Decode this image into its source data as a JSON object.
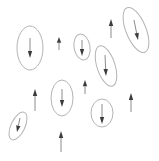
{
  "diagram": {
    "type": "vector-field-with-error-ellipses",
    "width": 159,
    "height": 161,
    "background": "#ffffff",
    "colors": {
      "ellipse_stroke": "#b4b4b4",
      "arrow_shaft": "#8c8c8c",
      "arrow_head": "#3c3c3c"
    },
    "ellipse_vectors": [
      {
        "id": "ev1",
        "cx": 30,
        "cy": 48,
        "rx": 13,
        "ry": 22,
        "rotate": 0,
        "x1": 30,
        "y1": 38,
        "x2": 30,
        "y2": 58,
        "direction": "down"
      },
      {
        "id": "ev2",
        "cx": 136,
        "cy": 30,
        "rx": 10,
        "ry": 24,
        "rotate": -22,
        "x1": 134,
        "y1": 20,
        "x2": 138,
        "y2": 40,
        "direction": "down"
      },
      {
        "id": "ev3",
        "cx": 106,
        "cy": 66,
        "rx": 9,
        "ry": 21,
        "rotate": -18,
        "x1": 105,
        "y1": 55,
        "x2": 106,
        "y2": 76,
        "direction": "down"
      },
      {
        "id": "ev4",
        "cx": 62,
        "cy": 98,
        "rx": 11,
        "ry": 18,
        "rotate": 0,
        "x1": 62,
        "y1": 89,
        "x2": 62,
        "y2": 107,
        "direction": "down"
      },
      {
        "id": "ev5",
        "cx": 18,
        "cy": 126,
        "rx": 7,
        "ry": 15,
        "rotate": 25,
        "x1": 20,
        "y1": 118,
        "x2": 17,
        "y2": 132,
        "direction": "down"
      },
      {
        "id": "ev6",
        "cx": 102,
        "cy": 113,
        "rx": 11,
        "ry": 14,
        "rotate": 0,
        "x1": 102,
        "y1": 104,
        "x2": 102,
        "y2": 124,
        "direction": "down"
      },
      {
        "id": "ev7",
        "cx": 82,
        "cy": 47,
        "rx": 8,
        "ry": 13,
        "rotate": -10,
        "x1": 82,
        "y1": 40,
        "x2": 82,
        "y2": 56,
        "direction": "down"
      }
    ],
    "free_vectors": [
      {
        "id": "fv1",
        "x1": 59,
        "y1": 50,
        "x2": 59,
        "y2": 37,
        "direction": "up"
      },
      {
        "id": "fv2",
        "x1": 111,
        "y1": 38,
        "x2": 111,
        "y2": 19,
        "direction": "up"
      },
      {
        "id": "fv3",
        "x1": 35,
        "y1": 111,
        "x2": 35,
        "y2": 89,
        "direction": "up"
      },
      {
        "id": "fv4",
        "x1": 131,
        "y1": 112,
        "x2": 131,
        "y2": 93,
        "direction": "up"
      },
      {
        "id": "fv5",
        "x1": 61,
        "y1": 152,
        "x2": 61,
        "y2": 131,
        "direction": "up"
      },
      {
        "id": "fv6",
        "x1": 85,
        "y1": 94,
        "x2": 85,
        "y2": 80,
        "direction": "up"
      }
    ]
  }
}
